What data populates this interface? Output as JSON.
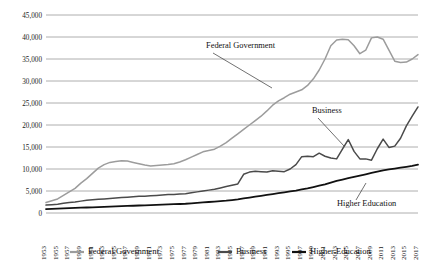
{
  "chart_data": {
    "type": "line",
    "title": "",
    "xlabel": "",
    "ylabel": "",
    "ylim": [
      0,
      45000
    ],
    "ytick_step": 5000,
    "grid": true,
    "legend_position": "bottom",
    "y_ticks": [
      "0",
      "5,000",
      "10,000",
      "15,000",
      "20,000",
      "25,000",
      "30,000",
      "35,000",
      "40,000",
      "45,000"
    ],
    "x_tick_labels": [
      "1953",
      "1955",
      "1957",
      "1959",
      "1961",
      "1963",
      "1965",
      "1967",
      "1969",
      "1971",
      "1973",
      "1975",
      "1977",
      "1979",
      "1981",
      "1983",
      "1985",
      "1987",
      "1989",
      "1991",
      "1993",
      "1995",
      "1997",
      "1999",
      "2001",
      "2003",
      "2005",
      "2007",
      "2009",
      "2011",
      "2013",
      "2015",
      "2017"
    ],
    "x": [
      1953,
      1954,
      1955,
      1956,
      1957,
      1958,
      1959,
      1960,
      1961,
      1962,
      1963,
      1964,
      1965,
      1966,
      1967,
      1968,
      1969,
      1970,
      1971,
      1972,
      1973,
      1974,
      1975,
      1976,
      1977,
      1978,
      1979,
      1980,
      1981,
      1982,
      1983,
      1984,
      1985,
      1986,
      1987,
      1988,
      1989,
      1990,
      1991,
      1992,
      1993,
      1994,
      1995,
      1996,
      1997,
      1998,
      1999,
      2000,
      2001,
      2002,
      2003,
      2004,
      2005,
      2006,
      2007,
      2008,
      2009,
      2010,
      2011,
      2012,
      2013,
      2014,
      2015,
      2016,
      2017
    ],
    "series": [
      {
        "name": "Federal Government",
        "color": "#9c9c9c",
        "width": 1.5,
        "values": [
          2400,
          2800,
          3200,
          4000,
          4800,
          5600,
          6800,
          7800,
          9000,
          10200,
          11000,
          11500,
          11700,
          11900,
          11800,
          11500,
          11200,
          10900,
          10700,
          10800,
          10900,
          11000,
          11200,
          11600,
          12100,
          12700,
          13300,
          13900,
          14200,
          14500,
          15200,
          16000,
          17000,
          18000,
          19000,
          20000,
          21000,
          22000,
          23200,
          24500,
          25500,
          26200,
          27000,
          27500,
          28000,
          29000,
          30500,
          32500,
          35000,
          38000,
          39300,
          39500,
          39400,
          38000,
          36200,
          37000,
          39800,
          40000,
          39500,
          37000,
          34500,
          34200,
          34300,
          35000,
          36000
        ]
      },
      {
        "name": "Business",
        "color": "#4a4a4a",
        "width": 1.5,
        "values": [
          1800,
          1900,
          2000,
          2200,
          2400,
          2500,
          2700,
          2900,
          3000,
          3100,
          3200,
          3300,
          3400,
          3500,
          3600,
          3700,
          3800,
          3800,
          3900,
          4000,
          4100,
          4200,
          4200,
          4300,
          4400,
          4600,
          4800,
          5000,
          5200,
          5400,
          5700,
          6000,
          6300,
          6600,
          8800,
          9300,
          9500,
          9400,
          9300,
          9600,
          9500,
          9400,
          10000,
          11000,
          12800,
          12900,
          12800,
          13600,
          12900,
          12500,
          12300,
          14500,
          16700,
          14000,
          12300,
          12300,
          12000,
          14600,
          16800,
          14900,
          15200,
          17000,
          19800,
          22000,
          24100
        ]
      },
      {
        "name": "Higher Education",
        "color": "#111111",
        "width": 1.8,
        "values": [
          900,
          950,
          1000,
          1050,
          1100,
          1150,
          1200,
          1250,
          1300,
          1350,
          1400,
          1450,
          1500,
          1550,
          1600,
          1650,
          1700,
          1750,
          1800,
          1850,
          1900,
          1950,
          2000,
          2050,
          2100,
          2200,
          2300,
          2400,
          2500,
          2600,
          2700,
          2800,
          2950,
          3100,
          3300,
          3500,
          3700,
          3900,
          4100,
          4300,
          4500,
          4700,
          4900,
          5100,
          5350,
          5600,
          5900,
          6200,
          6500,
          6900,
          7300,
          7600,
          7900,
          8200,
          8500,
          8800,
          9100,
          9400,
          9700,
          9900,
          10100,
          10300,
          10500,
          10700,
          11000
        ]
      }
    ],
    "annotations": [
      {
        "text": "Federal Government",
        "x": 206,
        "y": 48
      },
      {
        "text": "Business",
        "x": 312,
        "y": 113
      },
      {
        "text": "Higher Education",
        "x": 337,
        "y": 206
      }
    ],
    "legend": [
      {
        "label": "Federal Government",
        "color": "#9c9c9c"
      },
      {
        "label": "Business",
        "color": "#4a4a4a"
      },
      {
        "label": "Higher Education",
        "color": "#111111"
      }
    ]
  }
}
